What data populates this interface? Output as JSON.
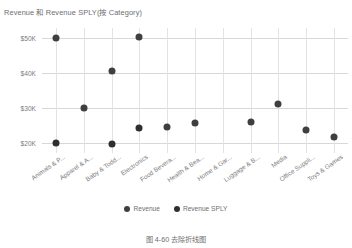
{
  "chart_data": {
    "type": "scatter",
    "title": "Revenue 和 Revenue SPLY(按 Category)",
    "xlabel": "",
    "ylabel": "",
    "ylim": [
      17000,
      53000
    ],
    "ytick_values": [
      50000,
      40000,
      30000,
      20000
    ],
    "ytick_labels": [
      "$50K",
      "$40K",
      "$30K",
      "$20K"
    ],
    "grid": true,
    "legend_position": "bottom",
    "categories": [
      "Animals & P...",
      "Apparel & A...",
      "Baby & Todd...",
      "Electronics",
      "Food Bevera...",
      "Health & Bea...",
      "Home & Gar...",
      "Luggage & B...",
      "Media",
      "Office Suppli...",
      "Toys & Games"
    ],
    "series": [
      {
        "name": "Revenue",
        "color": "#3f3f42",
        "values": [
          50200,
          30000,
          40500,
          50400,
          24500,
          25500,
          null,
          26000,
          31000,
          23500,
          21500
        ]
      },
      {
        "name": "Revenue SPLY",
        "color": "#2f2f31",
        "values": [
          19800,
          null,
          19600,
          24300,
          null,
          null,
          null,
          null,
          null,
          null,
          null
        ]
      }
    ],
    "points": [
      {
        "category": "Animals & P...",
        "series": "Revenue",
        "value": 50200
      },
      {
        "category": "Animals & P...",
        "series": "Revenue SPLY",
        "value": 19800
      },
      {
        "category": "Apparel & A...",
        "series": "Revenue",
        "value": 30000
      },
      {
        "category": "Baby & Todd...",
        "series": "Revenue",
        "value": 40500
      },
      {
        "category": "Baby & Todd...",
        "series": "Revenue SPLY",
        "value": 19600
      },
      {
        "category": "Electronics",
        "series": "Revenue",
        "value": 50400
      },
      {
        "category": "Electronics",
        "series": "Revenue SPLY",
        "value": 24300
      },
      {
        "category": "Food Bevera...",
        "series": "Revenue",
        "value": 24500
      },
      {
        "category": "Health & Bea...",
        "series": "Revenue",
        "value": 25500
      },
      {
        "category": "Luggage & B...",
        "series": "Revenue",
        "value": 26000
      },
      {
        "category": "Media",
        "series": "Revenue",
        "value": 31000
      },
      {
        "category": "Office Suppli...",
        "series": "Revenue",
        "value": 23500
      },
      {
        "category": "Toys & Games",
        "series": "Revenue",
        "value": 21500
      }
    ]
  },
  "legend": {
    "items": [
      {
        "label": "Revenue",
        "color": "#3f3f42"
      },
      {
        "label": "Revenue SPLY",
        "color": "#2f2f31"
      }
    ]
  },
  "caption": {
    "text": "图 4-60   去除折线图"
  }
}
